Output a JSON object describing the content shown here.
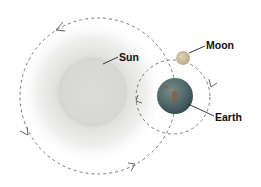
{
  "diagram": {
    "type": "sun-earth-moon-orbits",
    "labels": {
      "sun": "Sun",
      "moon": "Moon",
      "earth": "Earth"
    },
    "colors": {
      "background": "#ffffff",
      "orbit_line": "#7a7a7a",
      "leader_line": "#222222",
      "label_text": "#111111",
      "sun_core": "#d9d9d6",
      "sun_glow": "#ececeb",
      "earth_ocean": "#4d6470",
      "earth_land": "#8a5a4a",
      "moon": "#c9bd9e"
    }
  }
}
